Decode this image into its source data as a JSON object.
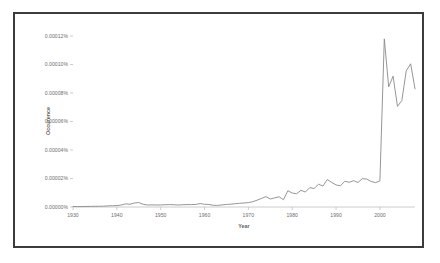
{
  "figure": {
    "border_color": "#3c3c3c",
    "background_color": "#ffffff"
  },
  "chart_data": {
    "type": "line",
    "title": "",
    "xlabel": "Year",
    "ylabel": "Occurence",
    "xlim": [
      1930,
      2008
    ],
    "ylim": [
      0.0,
      0.00012
    ],
    "grid": false,
    "legend": "none",
    "line_color": "#8a8a8a",
    "line_width": 0.9,
    "y_tick_labels": [
      "0.00000%",
      "0.00002%",
      "0.00004%",
      "0.00006%",
      "0.00008%",
      "0.00010%",
      "0.00012%"
    ],
    "y_tick_values": [
      0.0,
      2e-05,
      4e-05,
      6e-05,
      8e-05,
      0.0001,
      0.00012
    ],
    "x_tick_labels": [
      "1930",
      "1940",
      "1950",
      "1960",
      "1970",
      "1980",
      "1990",
      "2000"
    ],
    "x_tick_values": [
      1930,
      1940,
      1950,
      1960,
      1970,
      1980,
      1990,
      2000
    ],
    "series": [
      {
        "name": "Occurence",
        "x": [
          1930,
          1931,
          1932,
          1933,
          1934,
          1935,
          1936,
          1937,
          1938,
          1939,
          1940,
          1941,
          1942,
          1943,
          1944,
          1945,
          1946,
          1947,
          1948,
          1949,
          1950,
          1951,
          1952,
          1953,
          1954,
          1955,
          1956,
          1957,
          1958,
          1959,
          1960,
          1961,
          1962,
          1963,
          1964,
          1965,
          1966,
          1967,
          1968,
          1969,
          1970,
          1971,
          1972,
          1973,
          1974,
          1975,
          1976,
          1977,
          1978,
          1979,
          1980,
          1981,
          1982,
          1983,
          1984,
          1985,
          1986,
          1987,
          1988,
          1989,
          1990,
          1991,
          1992,
          1993,
          1994,
          1995,
          1996,
          1997,
          1998,
          1999,
          2000,
          2001,
          2002,
          2003,
          2004,
          2005,
          2006,
          2007,
          2008
        ],
        "values": [
          4e-07,
          3e-07,
          3e-07,
          4e-07,
          4e-07,
          5e-07,
          5e-07,
          6e-07,
          8e-07,
          9e-07,
          1e-06,
          1.4e-06,
          2.2e-06,
          1.9e-06,
          2.8e-06,
          3.1e-06,
          1.9e-06,
          1.4e-06,
          1.5e-06,
          1.4e-06,
          1.4e-06,
          1.6e-06,
          1.7e-06,
          1.6e-06,
          1.4e-06,
          1.6e-06,
          1.7e-06,
          1.7e-06,
          1.8e-06,
          2.4e-06,
          1.9e-06,
          1.8e-06,
          1.2e-06,
          1.1e-06,
          1.5e-06,
          1.8e-06,
          2e-06,
          2.3e-06,
          2.6e-06,
          2.8e-06,
          3.1e-06,
          3.7e-06,
          4.8e-06,
          6e-06,
          7.3e-06,
          5.6e-06,
          6.4e-06,
          7.2e-06,
          5.1e-06,
          1.14e-05,
          9.8e-06,
          9.3e-06,
          1.17e-05,
          1.05e-05,
          1.36e-05,
          1.3e-05,
          1.6e-05,
          1.47e-05,
          1.93e-05,
          1.72e-05,
          1.55e-05,
          1.49e-05,
          1.81e-05,
          1.73e-05,
          1.85e-05,
          1.72e-05,
          1.99e-05,
          1.96e-05,
          1.79e-05,
          1.71e-05,
          1.83e-05,
          0.000118,
          8.43e-05,
          9.18e-05,
          7.06e-05,
          7.47e-05,
          9.55e-05,
          0.0001005,
          8.3e-05
        ]
      }
    ]
  }
}
